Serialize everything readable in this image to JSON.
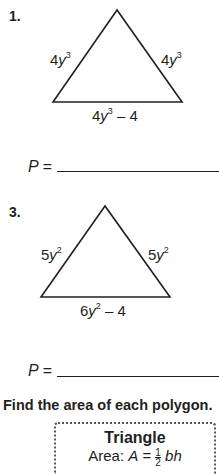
{
  "problems": [
    {
      "number": "1.",
      "shape": "triangle",
      "sides": {
        "left": {
          "coef": "4",
          "var": "y",
          "exp": "3",
          "rest": ""
        },
        "right": {
          "coef": "4",
          "var": "y",
          "exp": "3",
          "rest": ""
        },
        "base": {
          "coef": "4",
          "var": "y",
          "exp": "3",
          "rest": " – 4"
        }
      },
      "answer_label": "P ="
    },
    {
      "number": "3.",
      "shape": "triangle",
      "sides": {
        "left": {
          "coef": "5",
          "var": "y",
          "exp": "2",
          "rest": ""
        },
        "right": {
          "coef": "5",
          "var": "y",
          "exp": "2",
          "rest": ""
        },
        "base": {
          "coef": "6",
          "var": "y",
          "exp": "2",
          "rest": " – 4"
        }
      },
      "answer_label": "P ="
    }
  ],
  "section_heading": "Find the area of each polygon.",
  "formula_box": {
    "title": "Triangle",
    "formula_prefix": "Area: ",
    "formula_var": "A",
    "formula_eq": " = ",
    "frac_num": "1",
    "frac_den": "2",
    "formula_rest": "bh"
  },
  "colors": {
    "ink": "#231f20",
    "box_border": "#555555"
  }
}
